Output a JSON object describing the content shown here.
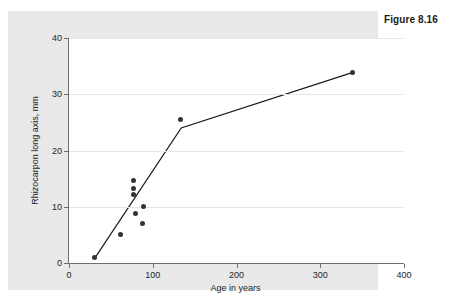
{
  "figure": {
    "caption": "Figure 8.16"
  },
  "chart_data": {
    "type": "scatter",
    "title": "",
    "subtitle": "",
    "xlabel": "Age in years",
    "ylabel": "Rhizocarpon long axis, mm",
    "xlim": [
      0,
      400
    ],
    "ylim": [
      0,
      40
    ],
    "xticks": [
      0,
      100,
      200,
      300,
      400
    ],
    "xtick_labels": [
      "0",
      "100",
      "200",
      "300",
      "400"
    ],
    "yticks": [
      0,
      10,
      20,
      30,
      40
    ],
    "ytick_labels": [
      "0",
      "10",
      "20",
      "30",
      "40"
    ],
    "grid": "horizontal",
    "legend": null,
    "legend_position": "none",
    "point_color": "#333333",
    "line_color": "#1a1a1a",
    "marker": "filled-circle",
    "series": [
      {
        "name": "Rhizocarpon measurements",
        "type": "scatter",
        "points": [
          {
            "x": 31,
            "y": 0.9
          },
          {
            "x": 62,
            "y": 5.1
          },
          {
            "x": 77,
            "y": 14.6
          },
          {
            "x": 77,
            "y": 13.3
          },
          {
            "x": 77,
            "y": 12.1
          },
          {
            "x": 79,
            "y": 8.8
          },
          {
            "x": 89,
            "y": 10.0
          },
          {
            "x": 88,
            "y": 7.1
          },
          {
            "x": 133,
            "y": 25.5
          },
          {
            "x": 339,
            "y": 33.9
          }
        ]
      },
      {
        "name": "Fitted two-segment growth curve",
        "type": "line",
        "points": [
          {
            "x": 31,
            "y": 0.9
          },
          {
            "x": 134,
            "y": 24.0
          },
          {
            "x": 339,
            "y": 33.9
          }
        ]
      }
    ]
  }
}
